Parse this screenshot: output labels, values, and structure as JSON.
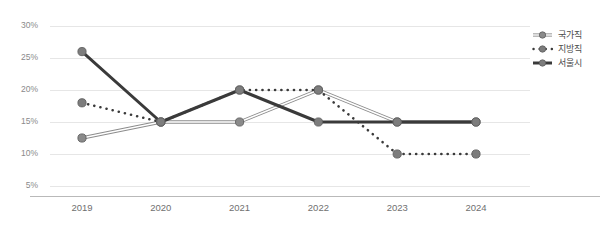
{
  "chart_data": {
    "type": "line",
    "title": "",
    "subtitle": "",
    "xlabel": "",
    "ylabel": "",
    "categories": [
      "2019",
      "2020",
      "2021",
      "2022",
      "2023",
      "2024"
    ],
    "ylim": [
      5,
      30
    ],
    "yticks": [
      5,
      10,
      15,
      20,
      25,
      30
    ],
    "ytick_labels": [
      "5%",
      "10%",
      "15%",
      "20%",
      "25%",
      "30%"
    ],
    "grid": true,
    "legend_position": "right",
    "value_suffix": "%",
    "series": [
      {
        "name": "국가직",
        "style": "thin-double-line",
        "color": "#8c8c8c",
        "marker_color": "#8a8a8a",
        "values": [
          12.5,
          15,
          15,
          20,
          15,
          15
        ]
      },
      {
        "name": "지방직",
        "style": "dotted-line",
        "color": "#3a3a3a",
        "marker_color": "#7d7d7d",
        "values": [
          18,
          15,
          20,
          20,
          10,
          10
        ]
      },
      {
        "name": "서울시",
        "style": "thick-solid-line",
        "color": "#3a3a3a",
        "marker_color": "#7d7d7d",
        "values": [
          26,
          15,
          20,
          15,
          15,
          15
        ]
      }
    ]
  },
  "axis": {
    "grid_color": "#e6e6e6",
    "axis_color": "#b9b9b9",
    "tick_text_color": "#8a8a8a",
    "xtick_text_color": "#6f6f6f"
  },
  "legend": {
    "entries": [
      {
        "label": "국가직",
        "glyph": "double-line-marker"
      },
      {
        "label": "지방직",
        "glyph": "dotted-line-marker"
      },
      {
        "label": "서울시",
        "glyph": "solid-line-marker"
      }
    ]
  }
}
